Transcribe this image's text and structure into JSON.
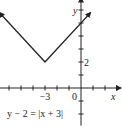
{
  "chart_data": {
    "type": "line",
    "title": "",
    "equation": "y − 2 = |x + 3|",
    "xlabel": "x",
    "ylabel": "y",
    "xlim": [
      -6.8,
      3
    ],
    "ylim": [
      -2.9,
      6.8
    ],
    "x_tick_step": 1,
    "y_tick_step": 1,
    "x_tick_labels": [
      {
        "value": -3,
        "label": "−3"
      },
      {
        "value": 0,
        "label": "0"
      }
    ],
    "y_tick_labels": [
      {
        "value": 2,
        "label": "2"
      }
    ],
    "series": [
      {
        "name": "y = |x + 3| + 2",
        "x": [
          -6.8,
          -3,
          0.8
        ],
        "y": [
          5.8,
          2,
          5.8
        ],
        "arrows": "both",
        "color": "#222222"
      }
    ],
    "grid": false
  }
}
